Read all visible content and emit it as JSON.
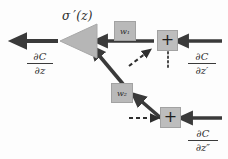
{
  "figure": {
    "type": "computational-graph",
    "background_color": "#fdfdfd",
    "node_fill_color": "#b6b6b6",
    "arrow_color": "#3a3a3a"
  },
  "labels": {
    "activation_derivative": "σ ′(z)"
  },
  "gradients": {
    "output": {
      "numerator": "∂C",
      "denominator": "∂z"
    },
    "input_upper": {
      "numerator": "∂C",
      "denominator": "∂z′"
    },
    "input_lower": {
      "numerator": "∂C",
      "denominator": "∂z″"
    }
  },
  "nodes": {
    "sigma_triangle": {
      "label": "",
      "shape": "triangle-left"
    },
    "weight_upper": {
      "label": "w₁"
    },
    "weight_lower": {
      "label": "w₂"
    },
    "sum_upper": {
      "label": "+"
    },
    "sum_lower": {
      "label": "+"
    }
  }
}
